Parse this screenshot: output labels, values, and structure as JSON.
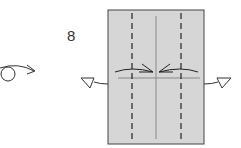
{
  "step": {
    "number": "8"
  },
  "diagram": {
    "paper_fill": "#d6d6d6",
    "line_color": "#333333",
    "crease_color": "#888888",
    "symbols": [
      {
        "name": "turn-over-icon",
        "description": "Turn model over"
      },
      {
        "name": "valley-fold-lines",
        "description": "Two vertical dashed valley-fold lines"
      },
      {
        "name": "center-crease",
        "description": "Vertical center crease"
      },
      {
        "name": "fold-to-center-arrows",
        "description": "Arrows folding edges to center"
      },
      {
        "name": "unfold-left-arrow",
        "description": "Hollow arrow pointing left"
      },
      {
        "name": "unfold-right-arrow",
        "description": "Hollow arrow pointing right"
      }
    ]
  }
}
